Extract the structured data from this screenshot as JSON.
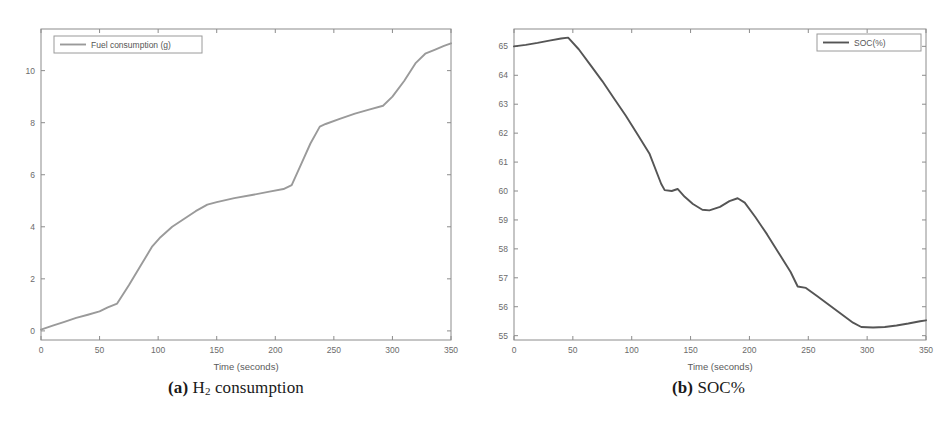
{
  "figure": {
    "panels": [
      {
        "id": "panel-a",
        "caption_prefix": "(a)",
        "caption_main_pre": "H",
        "caption_sub": "2",
        "caption_main_post": " consumption",
        "caption_plain": "(a) H2 consumption"
      },
      {
        "id": "panel-b",
        "caption_prefix": "(b)",
        "caption_main_pre": "SOC%",
        "caption_sub": "",
        "caption_main_post": "",
        "caption_plain": "(b) SOC%"
      }
    ]
  },
  "colors": {
    "line_a": "#9a9a9a",
    "line_b": "#555555",
    "axis": "#8c8c8c",
    "tick_text": "#6b6b6b",
    "background": "#ffffff",
    "legend_border": "#9a9a9a"
  },
  "chart_data": [
    {
      "type": "line",
      "title": "",
      "subtitle": "",
      "xlabel": "Time (seconds)",
      "ylabel": "",
      "xlim": [
        0,
        350
      ],
      "ylim": [
        -0.35,
        11.6
      ],
      "grid": false,
      "legend_position": "top-left",
      "xticks": [
        0,
        50,
        100,
        150,
        200,
        250,
        300,
        350
      ],
      "xtick_labels": [
        "0",
        "50",
        "100",
        "150",
        "200",
        "250",
        "300",
        "350"
      ],
      "yticks": [
        0,
        2,
        4,
        6,
        8,
        10
      ],
      "ytick_labels": [
        "0",
        "2",
        "4",
        "6",
        "8",
        "10"
      ],
      "series": [
        {
          "name": "Fuel consumption (g)",
          "color": "#9a9a9a",
          "x": [
            0,
            10,
            20,
            30,
            40,
            50,
            57,
            65,
            75,
            85,
            95,
            102,
            112,
            122,
            132,
            142,
            150,
            165,
            180,
            195,
            207,
            214,
            222,
            230,
            238,
            243,
            255,
            268,
            280,
            292,
            300,
            310,
            320,
            328,
            336,
            344,
            350
          ],
          "y": [
            0.05,
            0.2,
            0.35,
            0.5,
            0.62,
            0.75,
            0.9,
            1.05,
            1.75,
            2.5,
            3.25,
            3.6,
            4.0,
            4.3,
            4.6,
            4.85,
            4.95,
            5.1,
            5.22,
            5.35,
            5.45,
            5.6,
            6.4,
            7.2,
            7.85,
            7.95,
            8.15,
            8.35,
            8.5,
            8.65,
            9.0,
            9.6,
            10.3,
            10.65,
            10.8,
            10.95,
            11.05
          ]
        }
      ]
    },
    {
      "type": "line",
      "title": "",
      "subtitle": "",
      "xlabel": "Time (seconds)",
      "ylabel": "",
      "xlim": [
        0,
        350
      ],
      "ylim": [
        54.85,
        65.6
      ],
      "grid": false,
      "legend_position": "top-right",
      "xticks": [
        0,
        50,
        100,
        150,
        200,
        250,
        300,
        350
      ],
      "xtick_labels": [
        "0",
        "50",
        "100",
        "150",
        "200",
        "250",
        "300",
        "350"
      ],
      "yticks": [
        55,
        56,
        57,
        58,
        59,
        60,
        61,
        62,
        63,
        64,
        65
      ],
      "ytick_labels": [
        "55",
        "56",
        "57",
        "58",
        "59",
        "60",
        "61",
        "62",
        "63",
        "64",
        "65"
      ],
      "series": [
        {
          "name": "SOC(%)",
          "color": "#555555",
          "x": [
            0,
            10,
            20,
            30,
            40,
            46,
            55,
            65,
            75,
            85,
            95,
            105,
            115,
            125,
            128,
            134,
            139,
            145,
            152,
            160,
            166,
            175,
            183,
            190,
            196,
            205,
            215,
            225,
            235,
            241,
            248,
            258,
            268,
            278,
            288,
            295,
            305,
            315,
            325,
            335,
            345,
            350
          ],
          "y": [
            65.0,
            65.05,
            65.12,
            65.2,
            65.27,
            65.3,
            64.9,
            64.35,
            63.8,
            63.2,
            62.6,
            61.95,
            61.3,
            60.25,
            60.03,
            60.0,
            60.07,
            59.8,
            59.55,
            59.35,
            59.33,
            59.45,
            59.65,
            59.75,
            59.6,
            59.1,
            58.5,
            57.85,
            57.2,
            56.7,
            56.65,
            56.35,
            56.05,
            55.75,
            55.45,
            55.3,
            55.28,
            55.3,
            55.35,
            55.42,
            55.5,
            55.53
          ]
        }
      ]
    }
  ]
}
